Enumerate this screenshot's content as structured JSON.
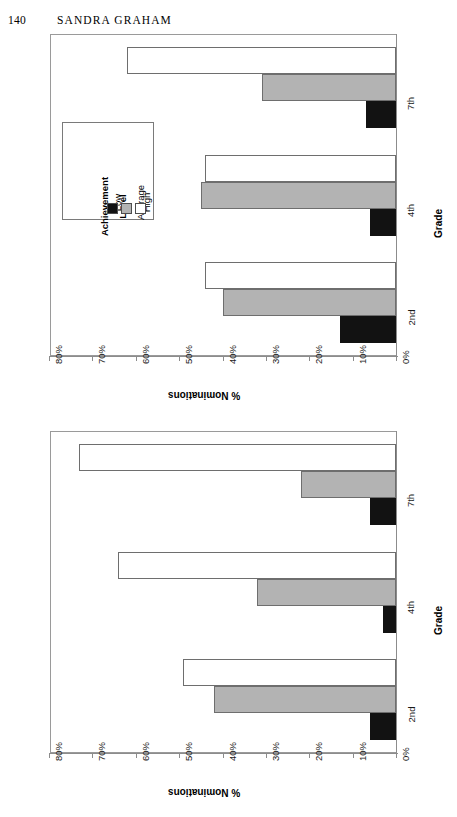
{
  "page": {
    "number": "140",
    "running_head": "SANDRA GRAHAM"
  },
  "legend": {
    "title_line1": "Achievement",
    "title_line2": "Level",
    "entries": [
      {
        "label": "Low",
        "color": "#121212"
      },
      {
        "label": "Average",
        "color": "#b3b3b3"
      },
      {
        "label": "High",
        "color": "#ffffff"
      }
    ]
  },
  "axes": {
    "value_axis_title": "% Nominations",
    "category_axis_title": "Grade",
    "value_ticks": [
      "80%",
      "70%",
      "60%",
      "50%",
      "40%",
      "30%",
      "20%",
      "10%",
      "0%"
    ],
    "categories": [
      "2nd",
      "4th",
      "7th"
    ]
  },
  "chart_data": [
    {
      "type": "bar",
      "title": "Latina Female Nominators",
      "orientation": "horizontal",
      "categories": [
        "2nd",
        "4th",
        "7th"
      ],
      "xlabel": "% Nominations",
      "ylabel": "Grade",
      "xlim": [
        0,
        80
      ],
      "grid": false,
      "legend_position": "inside-left",
      "series": [
        {
          "name": "Low",
          "color": "#121212",
          "values": [
            13,
            6,
            7
          ]
        },
        {
          "name": "Average",
          "color": "#b3b3b3",
          "values": [
            40,
            45,
            31
          ]
        },
        {
          "name": "High",
          "color": "#ffffff",
          "values": [
            44,
            44,
            62
          ]
        }
      ]
    },
    {
      "type": "bar",
      "title": "African American Female Nominators",
      "orientation": "horizontal",
      "categories": [
        "2nd",
        "4th",
        "7th"
      ],
      "xlabel": "% Nominations",
      "ylabel": "Grade",
      "xlim": [
        0,
        80
      ],
      "grid": false,
      "legend_position": "none",
      "series": [
        {
          "name": "Low",
          "color": "#121212",
          "values": [
            6,
            3,
            6
          ]
        },
        {
          "name": "Average",
          "color": "#b3b3b3",
          "values": [
            42,
            32,
            22
          ]
        },
        {
          "name": "High",
          "color": "#ffffff",
          "values": [
            49,
            64,
            73
          ]
        }
      ]
    }
  ]
}
